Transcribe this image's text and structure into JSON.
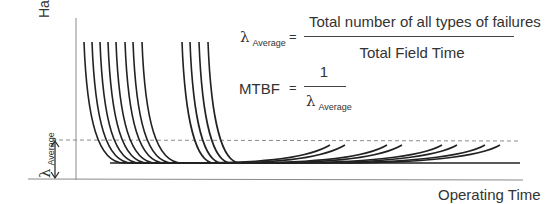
{
  "diagram": {
    "y_axis_label": "Hazard Rate λ(t)",
    "x_axis_label": "Operating Time",
    "lambda_avg_symbol": "λ",
    "lambda_avg_subscript": "Average",
    "formula1": {
      "lhs_symbol": "λ",
      "lhs_subscript": "Average",
      "equals": "=",
      "numerator": "Total number of all types of failures",
      "denominator": "Total Field Time"
    },
    "formula2": {
      "lhs": "MTBF",
      "equals": "=",
      "numerator": "1",
      "denominator_symbol": "λ",
      "denominator_subscript": "Average"
    },
    "colors": {
      "curve": "#222222",
      "axis": "#888888",
      "dashed": "#888888"
    },
    "infant_mortality_group1_x": [
      84,
      92,
      100,
      108,
      116,
      125,
      133,
      142
    ],
    "infant_mortality_group2_x": [
      182,
      190,
      199,
      208
    ],
    "wearout_tail_end_x": [
      330,
      345,
      387,
      402,
      442,
      457,
      485,
      500
    ]
  }
}
